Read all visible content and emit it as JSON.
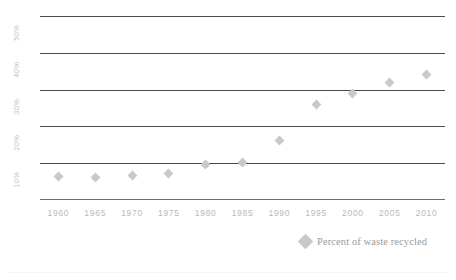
{
  "chart_data": {
    "type": "scatter",
    "title": "",
    "subtitle": "",
    "xlabel": "",
    "ylabel": "",
    "x": [
      1960,
      1965,
      1970,
      1975,
      1980,
      1985,
      1990,
      1995,
      2000,
      2005,
      2010
    ],
    "series": [
      {
        "name": "Percent of waste recycled",
        "values": [
          6.4,
          6.2,
          6.6,
          7.1,
          9.6,
          10.1,
          16.2,
          26.0,
          29.0,
          32.0,
          34.0
        ],
        "marker": "diamond",
        "color": "#c9c9c9"
      }
    ],
    "xlim": [
      1957.5,
      2012.5
    ],
    "ylim": [
      0,
      50
    ],
    "xticks": [
      1960,
      1965,
      1970,
      1975,
      1980,
      1985,
      1990,
      1995,
      2000,
      2005,
      2010
    ],
    "xticklabels": [
      "1960",
      "1965",
      "1970",
      "1975",
      "1980",
      "1985",
      "1990",
      "1995",
      "2000",
      "2005",
      "2010"
    ],
    "yticks": [
      10,
      20,
      30,
      40,
      50
    ],
    "yticklabels": [
      "10%",
      "20%",
      "30%",
      "40%",
      "50%"
    ],
    "grid": "horizontal",
    "grid_color": "#4a4a4a",
    "legend_position": "bottom-right",
    "background": "#ffffff",
    "tick_label_color": "#bdbdbd",
    "axis_line_color": "#6e6e6e"
  },
  "legend": {
    "entries": [
      {
        "label": "Percent of waste recycled",
        "swatch_icon": "diamond-marker-icon",
        "color": "#c9c9c9"
      }
    ]
  },
  "axes": {
    "y": {
      "ticks": [
        {
          "label": "50%",
          "value": 50
        },
        {
          "label": "40%",
          "value": 40
        },
        {
          "label": "30%",
          "value": 30
        },
        {
          "label": "20%",
          "value": 20
        },
        {
          "label": "10%",
          "value": 10
        }
      ]
    },
    "x": {
      "ticks": [
        {
          "label": "1960",
          "value": 1960
        },
        {
          "label": "1965",
          "value": 1965
        },
        {
          "label": "1970",
          "value": 1970
        },
        {
          "label": "1975",
          "value": 1975
        },
        {
          "label": "1980",
          "value": 1980
        },
        {
          "label": "1985",
          "value": 1985
        },
        {
          "label": "1990",
          "value": 1990
        },
        {
          "label": "1995",
          "value": 1995
        },
        {
          "label": "2000",
          "value": 2000
        },
        {
          "label": "2005",
          "value": 2005
        },
        {
          "label": "2010",
          "value": 2010
        }
      ]
    }
  }
}
